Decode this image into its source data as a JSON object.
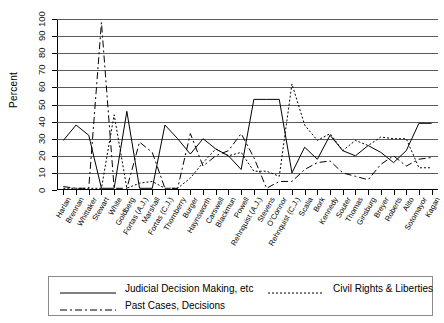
{
  "chart_data": {
    "type": "line",
    "title": "",
    "xlabel": "",
    "ylabel": "Percent",
    "ylim": [
      0,
      100
    ],
    "ytick_step": 10,
    "grid": true,
    "legend_position": "bottom",
    "ytick_labels": [
      "0",
      "10",
      "20",
      "30",
      "40",
      "50",
      "60",
      "70",
      "80",
      "90",
      "100"
    ],
    "categories": [
      "Harlan",
      "Brennan",
      "Whittaker",
      "Stewart",
      "White",
      "Goldberg",
      "Fortas (A.J.)",
      "Marshall",
      "Fortas (C.J.)",
      "Thornberry",
      "Burger",
      "Haynsworth",
      "Carswell",
      "Blackmun",
      "Powell",
      "Rehnquist (A.J.)",
      "Stevens",
      "O'Connor",
      "Rehnquist (C.J.)",
      "Scalia",
      "Bork",
      "Kennedy",
      "Souter",
      "Thomas",
      "Ginsburg",
      "Breyer",
      "Roberts",
      "Alito",
      "Sotomayor",
      "Kagan"
    ],
    "series": [
      {
        "name": "Judicial Decision Making, etc",
        "style": "solid",
        "values": [
          29,
          38,
          32,
          1,
          1,
          46,
          1,
          1,
          38,
          30,
          21,
          30,
          24,
          20,
          12,
          53,
          53,
          53,
          10,
          25,
          18,
          32,
          23,
          20,
          26,
          22,
          16,
          23,
          39,
          39
        ]
      },
      {
        "name": "Civil Rights & Liberties",
        "style": "dotted",
        "values": [
          1,
          1,
          1,
          1,
          44,
          1,
          4,
          5,
          1,
          1,
          7,
          16,
          24,
          20,
          22,
          11,
          11,
          8,
          62,
          38,
          29,
          33,
          23,
          29,
          26,
          31,
          30,
          30,
          13,
          13
        ]
      },
      {
        "name": "Past Cases, Decisions",
        "style": "dashdot",
        "values": [
          2,
          1,
          1,
          98,
          1,
          1,
          28,
          22,
          1,
          1,
          33,
          14,
          20,
          23,
          33,
          19,
          1,
          5,
          5,
          12,
          16,
          17,
          10,
          8,
          6,
          15,
          20,
          14,
          18,
          19
        ]
      }
    ]
  },
  "legend": {
    "entries": [
      {
        "label": "Judicial Decision Making, etc",
        "style": "solid"
      },
      {
        "label": "Civil Rights & Liberties",
        "style": "dotted"
      },
      {
        "label": "Past Cases, Decisions",
        "style": "dashdot"
      }
    ]
  }
}
